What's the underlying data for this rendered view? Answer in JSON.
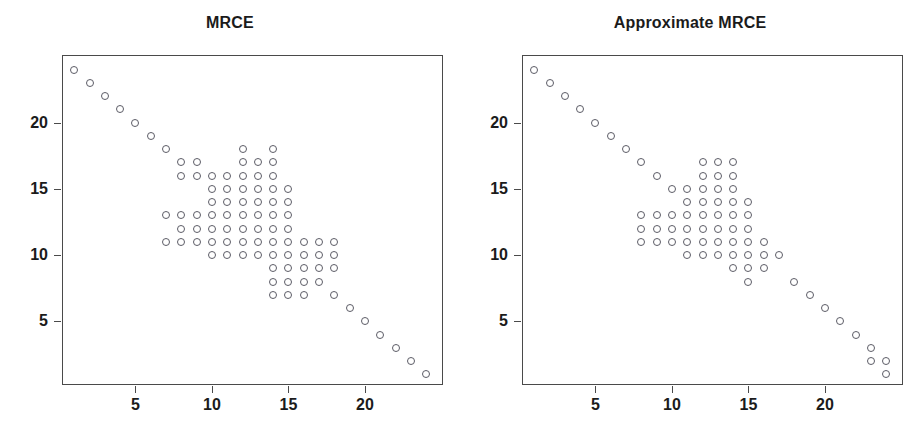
{
  "figure": {
    "width": 920,
    "height": 448,
    "background": "#ffffff",
    "marker_color": "#5c5c66",
    "frame_color": "#4a4a4a",
    "text_color": "#1b1b1b"
  },
  "axes": {
    "x_ticks": [
      5,
      10,
      15,
      20
    ],
    "y_ticks": [
      5,
      10,
      15,
      20
    ],
    "x_tick_labels": [
      "5",
      "10",
      "15",
      "20"
    ],
    "y_tick_labels": [
      "5",
      "10",
      "15",
      "20"
    ],
    "xlim": [
      0.2,
      25.1
    ],
    "ylim": [
      0.2,
      25.1
    ],
    "grid": false,
    "xlabel": "",
    "ylabel": ""
  },
  "chart_data": [
    {
      "type": "scatter",
      "title": "MRCE",
      "xlabel": "",
      "ylabel": "",
      "xlim": [
        0.2,
        25.1
      ],
      "ylim": [
        0.2,
        25.1
      ],
      "x_ticks": [
        5,
        10,
        15,
        20
      ],
      "y_ticks": [
        5,
        10,
        15,
        20
      ],
      "grid": false,
      "legend": null,
      "marker": "open-circle",
      "description": "Sparsity pattern of estimated precision matrix; anti-diagonal of 24 points plus off-diagonal block clusters.",
      "points": [
        [
          1,
          24
        ],
        [
          2,
          23
        ],
        [
          3,
          22
        ],
        [
          4,
          21
        ],
        [
          5,
          20
        ],
        [
          6,
          19
        ],
        [
          7,
          18
        ],
        [
          8,
          17
        ],
        [
          9,
          17
        ],
        [
          8,
          16
        ],
        [
          9,
          16
        ],
        [
          10,
          16
        ],
        [
          11,
          16
        ],
        [
          12,
          16
        ],
        [
          13,
          16
        ],
        [
          14,
          16
        ],
        [
          12,
          18
        ],
        [
          14,
          18
        ],
        [
          12,
          17
        ],
        [
          13,
          17
        ],
        [
          14,
          17
        ],
        [
          10,
          15
        ],
        [
          11,
          15
        ],
        [
          12,
          15
        ],
        [
          13,
          15
        ],
        [
          14,
          15
        ],
        [
          15,
          15
        ],
        [
          10,
          14
        ],
        [
          11,
          14
        ],
        [
          12,
          14
        ],
        [
          13,
          14
        ],
        [
          14,
          14
        ],
        [
          15,
          14
        ],
        [
          7,
          13
        ],
        [
          8,
          13
        ],
        [
          9,
          13
        ],
        [
          10,
          13
        ],
        [
          11,
          13
        ],
        [
          12,
          13
        ],
        [
          13,
          13
        ],
        [
          14,
          13
        ],
        [
          15,
          13
        ],
        [
          8,
          12
        ],
        [
          9,
          12
        ],
        [
          10,
          12
        ],
        [
          11,
          12
        ],
        [
          12,
          12
        ],
        [
          13,
          12
        ],
        [
          14,
          12
        ],
        [
          15,
          12
        ],
        [
          7,
          11
        ],
        [
          8,
          11
        ],
        [
          9,
          11
        ],
        [
          10,
          11
        ],
        [
          11,
          11
        ],
        [
          12,
          11
        ],
        [
          13,
          11
        ],
        [
          14,
          11
        ],
        [
          15,
          11
        ],
        [
          16,
          11
        ],
        [
          17,
          11
        ],
        [
          18,
          11
        ],
        [
          10,
          10
        ],
        [
          11,
          10
        ],
        [
          12,
          10
        ],
        [
          13,
          10
        ],
        [
          14,
          10
        ],
        [
          15,
          10
        ],
        [
          16,
          10
        ],
        [
          17,
          10
        ],
        [
          18,
          10
        ],
        [
          14,
          9
        ],
        [
          15,
          9
        ],
        [
          16,
          9
        ],
        [
          17,
          9
        ],
        [
          18,
          9
        ],
        [
          14,
          8
        ],
        [
          15,
          8
        ],
        [
          16,
          8
        ],
        [
          17,
          8
        ],
        [
          14,
          7
        ],
        [
          15,
          7
        ],
        [
          16,
          7
        ],
        [
          18,
          7
        ],
        [
          19,
          6
        ],
        [
          20,
          5
        ],
        [
          21,
          4
        ],
        [
          22,
          3
        ],
        [
          23,
          2
        ],
        [
          24,
          1
        ]
      ]
    },
    {
      "type": "scatter",
      "title": "Approximate MRCE",
      "xlabel": "",
      "ylabel": "",
      "xlim": [
        0.2,
        25.1
      ],
      "ylim": [
        0.2,
        25.1
      ],
      "x_ticks": [
        5,
        10,
        15,
        20
      ],
      "y_ticks": [
        5,
        10,
        15,
        20
      ],
      "grid": false,
      "legend": null,
      "marker": "open-circle",
      "description": "Sparsity pattern of approximate estimator; anti-diagonal of 24 points plus a sparser off-diagonal block cluster.",
      "points": [
        [
          1,
          24
        ],
        [
          2,
          23
        ],
        [
          3,
          22
        ],
        [
          4,
          21
        ],
        [
          5,
          20
        ],
        [
          6,
          19
        ],
        [
          7,
          18
        ],
        [
          8,
          17
        ],
        [
          9,
          16
        ],
        [
          12,
          17
        ],
        [
          13,
          17
        ],
        [
          14,
          17
        ],
        [
          12,
          16
        ],
        [
          13,
          16
        ],
        [
          14,
          16
        ],
        [
          10,
          15
        ],
        [
          11,
          15
        ],
        [
          12,
          15
        ],
        [
          13,
          15
        ],
        [
          14,
          15
        ],
        [
          11,
          14
        ],
        [
          12,
          14
        ],
        [
          13,
          14
        ],
        [
          14,
          14
        ],
        [
          15,
          14
        ],
        [
          8,
          13
        ],
        [
          9,
          13
        ],
        [
          10,
          13
        ],
        [
          11,
          13
        ],
        [
          12,
          13
        ],
        [
          13,
          13
        ],
        [
          14,
          13
        ],
        [
          15,
          13
        ],
        [
          8,
          12
        ],
        [
          9,
          12
        ],
        [
          10,
          12
        ],
        [
          11,
          12
        ],
        [
          12,
          12
        ],
        [
          13,
          12
        ],
        [
          14,
          12
        ],
        [
          15,
          12
        ],
        [
          8,
          11
        ],
        [
          9,
          11
        ],
        [
          10,
          11
        ],
        [
          11,
          11
        ],
        [
          12,
          11
        ],
        [
          13,
          11
        ],
        [
          14,
          11
        ],
        [
          15,
          11
        ],
        [
          16,
          11
        ],
        [
          11,
          10
        ],
        [
          12,
          10
        ],
        [
          13,
          10
        ],
        [
          14,
          10
        ],
        [
          15,
          10
        ],
        [
          16,
          10
        ],
        [
          17,
          10
        ],
        [
          14,
          9
        ],
        [
          15,
          9
        ],
        [
          16,
          9
        ],
        [
          15,
          8
        ],
        [
          18,
          8
        ],
        [
          19,
          7
        ],
        [
          20,
          6
        ],
        [
          21,
          5
        ],
        [
          22,
          4
        ],
        [
          23,
          3
        ],
        [
          24,
          2
        ],
        [
          24,
          1
        ],
        [
          23,
          2
        ]
      ]
    }
  ],
  "panels": [
    {
      "id": "left",
      "title": "MRCE"
    },
    {
      "id": "right",
      "title": "Approximate MRCE"
    }
  ]
}
